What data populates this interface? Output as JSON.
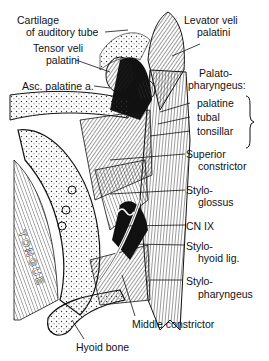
{
  "figure": {
    "background": "#ffffff",
    "ink": "#111111"
  },
  "labels": {
    "cartilage_line1": "Cartilage",
    "cartilage_line2": "of auditory tube",
    "tensor_line1": "Tensor veli",
    "tensor_line2": "palatini",
    "asc_palatine": "Asc. palatine a.",
    "levator_line1": "Levator veli",
    "levator_line2": "palatini",
    "palatopharyngeus_line1": "Palato-",
    "palatopharyngeus_line2": "pharyngeus:",
    "palatine": "palatine",
    "tubal": "tubal",
    "tonsillar": "tonsillar",
    "superior_line1": "Superior",
    "superior_line2": "constrictor",
    "styloglossus_line1": "Stylo-",
    "styloglossus_line2": "glossus",
    "cn_ix": "CN IX",
    "stylohyoid_line1": "Stylo-",
    "stylohyoid_line2": "hyoid lig.",
    "stylopharyngeus_line1": "Stylo-",
    "stylopharyngeus_line2": "pharyngeus",
    "middle_constrictor": "Middle constrictor",
    "hyoid_bone": "Hyoid bone",
    "tongue": "TONGUE"
  }
}
